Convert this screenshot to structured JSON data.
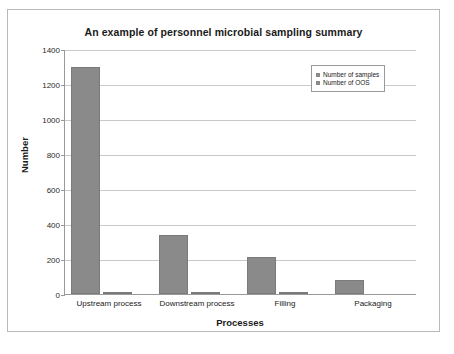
{
  "chart_data": {
    "type": "bar",
    "title": "An example of personnel microbial sampling summary",
    "xlabel": "Processes",
    "ylabel": "Number",
    "categories": [
      "Upstream process",
      "Downstream process",
      "Filling",
      "Packaging"
    ],
    "series": [
      {
        "name": "Number of samples",
        "values": [
          1300,
          340,
          210,
          80
        ]
      },
      {
        "name": "Number of OOS",
        "values": [
          8,
          5,
          3,
          0
        ]
      }
    ],
    "ylim": [
      0,
      1400
    ],
    "yticks": [
      0,
      200,
      400,
      600,
      800,
      1000,
      1200,
      1400
    ],
    "ytick_labels": [
      "0",
      "200",
      "400",
      "600",
      "800",
      "1000",
      "1200",
      "1400"
    ],
    "grid": true,
    "legend_position": "top-right",
    "colors": {
      "bar_fill": "#8a8a8a",
      "bar_border": "#7a7a7a",
      "gridline": "#c9c9c9",
      "axis": "#9a9a9a",
      "frame": "#b9b9b9",
      "text": "#1a1a1a",
      "background": "#ffffff"
    }
  }
}
